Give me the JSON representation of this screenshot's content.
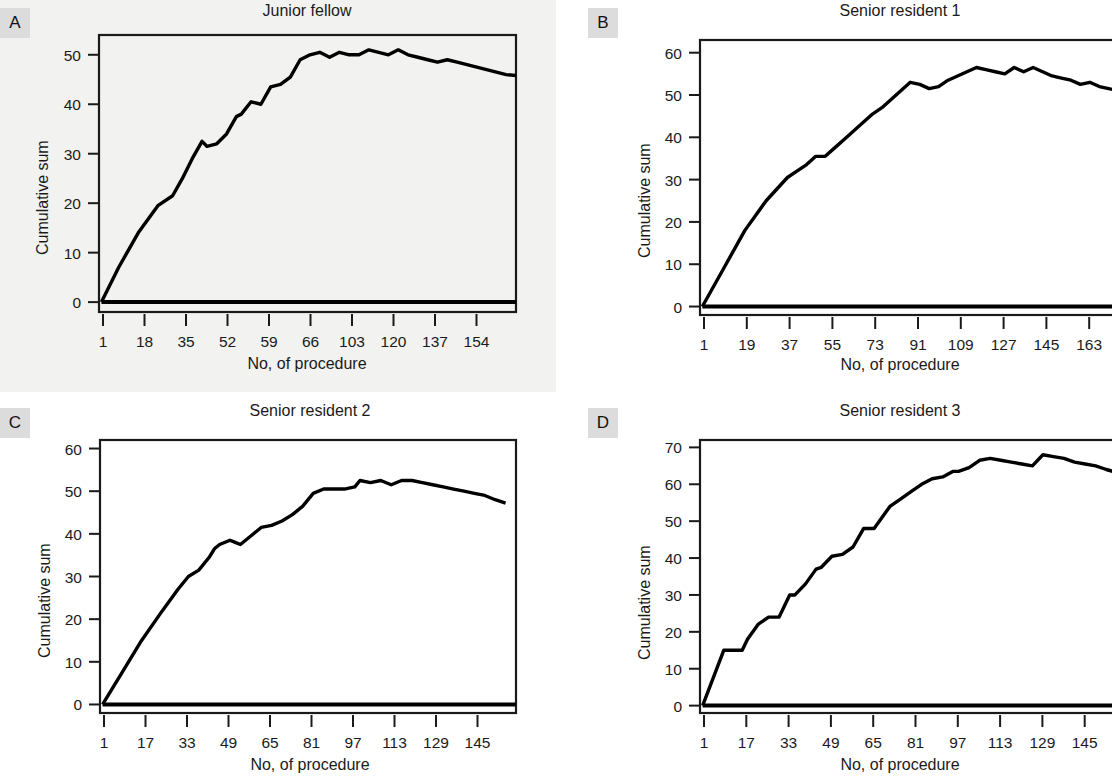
{
  "figure": {
    "background_color": "#ffffff",
    "label_box_color": "#dcdcdc",
    "line_color": "#000000"
  },
  "panels": [
    {
      "label": "A",
      "title": "Junior fellow",
      "xlabel": "No, of procedure",
      "ylabel": "Cumulative sum"
    },
    {
      "label": "B",
      "title": "Senior resident 1",
      "xlabel": "No, of procedure",
      "ylabel": "Cumulative sum"
    },
    {
      "label": "C",
      "title": "Senior resident 2",
      "xlabel": "No, of procedure",
      "ylabel": "Cumulative sum"
    },
    {
      "label": "D",
      "title": "Senior resident 3",
      "xlabel": "No, of procedure",
      "ylabel": "Cumulative sum"
    }
  ],
  "chart_data": [
    {
      "type": "line",
      "panel": "A",
      "title": "Junior fellow",
      "xlabel": "No, of procedure",
      "ylabel": "Cumulative sum",
      "grid": false,
      "legend": "none",
      "xtick_labels": [
        "1",
        "18",
        "35",
        "52",
        "59",
        "66",
        "103",
        "120",
        "137",
        "154"
      ],
      "ytick_labels": [
        "0",
        "10",
        "20",
        "30",
        "40",
        "50"
      ],
      "ylim": [
        -2,
        54
      ],
      "xlim": [
        0,
        170
      ],
      "series": [
        {
          "name": "CUSUM",
          "x": [
            1,
            8,
            16,
            24,
            30,
            34,
            38,
            42,
            44,
            48,
            52,
            56,
            58,
            62,
            66,
            70,
            74,
            78,
            82,
            86,
            90,
            94,
            98,
            102,
            106,
            110,
            114,
            118,
            122,
            126,
            130,
            134,
            138,
            142,
            146,
            150,
            154,
            158,
            162,
            166,
            170
          ],
          "y": [
            0,
            7,
            14,
            19.5,
            21.5,
            25,
            29,
            32.5,
            31.5,
            32,
            34,
            37.5,
            38,
            40.5,
            40,
            43.5,
            44,
            45.5,
            49,
            50,
            50.5,
            49.5,
            50.5,
            50,
            50,
            51,
            50.5,
            50,
            51,
            50,
            49.5,
            49,
            48.5,
            49,
            48.5,
            48,
            47.5,
            47,
            46.5,
            46,
            45.8
          ]
        },
        {
          "name": "Baseline (zero reference)",
          "x": [
            1,
            170
          ],
          "y": [
            0,
            0
          ]
        }
      ]
    },
    {
      "type": "line",
      "panel": "B",
      "title": "Senior resident 1",
      "xlabel": "No, of procedure",
      "ylabel": "Cumulative sum",
      "grid": false,
      "legend": "none",
      "xtick_labels": [
        "1",
        "19",
        "37",
        "55",
        "73",
        "91",
        "109",
        "127",
        "145",
        "163"
      ],
      "ytick_labels": [
        "0",
        "10",
        "20",
        "30",
        "40",
        "50",
        "60"
      ],
      "ylim": [
        -2,
        63
      ],
      "xlim": [
        0,
        182
      ],
      "series": [
        {
          "name": "CUSUM",
          "x": [
            1,
            10,
            19,
            28,
            37,
            41,
            45,
            49,
            53,
            57,
            61,
            65,
            69,
            73,
            77,
            81,
            85,
            89,
            93,
            97,
            101,
            105,
            109,
            113,
            117,
            121,
            125,
            129,
            133,
            137,
            141,
            145,
            149,
            153,
            157,
            161,
            165,
            169,
            173,
            177,
            181
          ],
          "y": [
            0,
            9,
            18,
            25,
            30.5,
            32,
            33.5,
            35.5,
            35.5,
            37.5,
            39.5,
            41.5,
            43.5,
            45.5,
            47,
            49,
            51,
            53,
            52.5,
            51.5,
            52,
            53.5,
            54.5,
            55.5,
            56.5,
            56,
            55.5,
            55,
            56.5,
            55.5,
            56.5,
            55.5,
            54.5,
            54,
            53.5,
            52.5,
            53,
            52,
            51.5,
            51,
            50.3
          ]
        },
        {
          "name": "Baseline (zero reference)",
          "x": [
            1,
            182
          ],
          "y": [
            0,
            0
          ]
        }
      ]
    },
    {
      "type": "line",
      "panel": "C",
      "title": "Senior resident 2",
      "xlabel": "No, of procedure",
      "ylabel": "Cumulative sum",
      "grid": false,
      "legend": "none",
      "xtick_labels": [
        "1",
        "17",
        "33",
        "49",
        "65",
        "81",
        "97",
        "113",
        "129",
        "145"
      ],
      "ytick_labels": [
        "0",
        "10",
        "20",
        "30",
        "40",
        "50",
        "60"
      ],
      "ylim": [
        -2,
        62
      ],
      "xlim": [
        0,
        160
      ],
      "series": [
        {
          "name": "CUSUM",
          "x": [
            1,
            8,
            16,
            24,
            30,
            34,
            38,
            42,
            44,
            46,
            50,
            52,
            54,
            58,
            62,
            66,
            70,
            74,
            78,
            82,
            86,
            90,
            94,
            98,
            100,
            104,
            108,
            112,
            116,
            120,
            124,
            128,
            132,
            136,
            140,
            144,
            148,
            152,
            156
          ],
          "y": [
            0,
            7,
            15,
            22,
            27,
            30,
            31.5,
            34.5,
            36.5,
            37.5,
            38.5,
            38,
            37.5,
            39.5,
            41.5,
            42,
            43,
            44.5,
            46.5,
            49.5,
            50.5,
            50.5,
            50.5,
            51,
            52.5,
            52,
            52.5,
            51.5,
            52.5,
            52.5,
            52,
            51.5,
            51,
            50.5,
            50,
            49.5,
            49,
            48,
            47.2
          ]
        },
        {
          "name": "Baseline (zero reference)",
          "x": [
            1,
            160
          ],
          "y": [
            0,
            0
          ]
        }
      ]
    },
    {
      "type": "line",
      "panel": "D",
      "title": "Senior resident 3",
      "xlabel": "No, of procedure",
      "ylabel": "Cumulative sum",
      "grid": false,
      "legend": "none",
      "xtick_labels": [
        "1",
        "17",
        "33",
        "49",
        "65",
        "81",
        "97",
        "113",
        "129",
        "145"
      ],
      "ytick_labels": [
        "0",
        "10",
        "20",
        "30",
        "40",
        "50",
        "60",
        "70"
      ],
      "ylim": [
        -2,
        72
      ],
      "xlim": [
        0,
        163
      ],
      "series": [
        {
          "name": "CUSUM",
          "x": [
            1,
            9,
            16,
            18,
            22,
            26,
            30,
            34,
            36,
            40,
            44,
            46,
            50,
            54,
            58,
            62,
            66,
            70,
            72,
            76,
            80,
            84,
            88,
            92,
            96,
            98,
            102,
            106,
            110,
            114,
            118,
            122,
            126,
            130,
            134,
            138,
            142,
            146,
            150,
            154,
            158
          ],
          "y": [
            0,
            15,
            15,
            18,
            22,
            24,
            24,
            30,
            30,
            33,
            37,
            37.5,
            40.5,
            41,
            43,
            48,
            48,
            52,
            54,
            56,
            58,
            60,
            61.5,
            62,
            63.5,
            63.5,
            64.5,
            66.5,
            67,
            66.5,
            66,
            65.5,
            65,
            68,
            67.5,
            67,
            66,
            65.5,
            65,
            64,
            63.2
          ]
        },
        {
          "name": "Baseline (zero reference)",
          "x": [
            1,
            163
          ],
          "y": [
            0,
            0
          ]
        }
      ]
    }
  ]
}
